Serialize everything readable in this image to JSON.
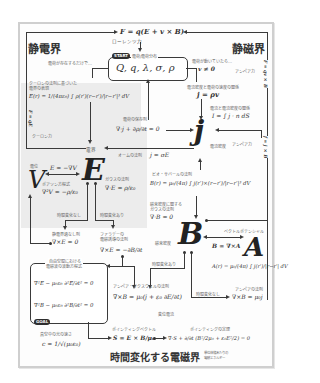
{
  "colors": {
    "panel_border": "#cfcfcf",
    "shade": "#ececec",
    "ink": "#2b2b2b",
    "badge": "#2e2e2e"
  },
  "headings": {
    "electrostatic": "静電界",
    "magnetostatic": "静磁界",
    "time_varying": "時間変化する電磁界"
  },
  "top": {
    "lorentz_force_eq": "F = q(E + v × B)",
    "lorentz_force_label": "ローレンツ力"
  },
  "start": {
    "badge": "START",
    "label": "電荷/電荷分布",
    "charges": "Q, q, λ, σ, ρ",
    "exists_only": "電荷が存在するだけで…",
    "if_moving": "電荷が動いていたら…",
    "v_nonzero": "v ≠ 0"
  },
  "coulomb": {
    "label1": "クーロンの法則に基づいた",
    "label2": "電界の表現",
    "eq": "E(r) = 1/(4πε₀) ∫ ρ(r′)(r−r′)/|r−r′|³ dV",
    "force_eq": "F = qE",
    "force_label": "クーロン力"
  },
  "current": {
    "density_rel_label": "電流密度と電荷の速度の関係",
    "density_rel_eq": "j = ρv",
    "current_rel_label": "電流と電流密度の関係",
    "current_rel_eq": "I = ∫ j · n dS",
    "continuity_label": "電荷の保存則",
    "continuity_eq": "∇·j + ∂ρ/∂t = 0",
    "symbol": "j",
    "symbol_label": "電流密度",
    "ohm_label": "オームの法則",
    "ohm_eq": "j = σE",
    "ampere_force_label": "アンペア力",
    "ampere_force_eq_top": "F = qv × B",
    "ampere_force_eq_mid": "f = j × B"
  },
  "efield": {
    "symbol": "E",
    "label": "電界",
    "gauss_label": "ガウスの法則",
    "gauss_eq": "∇·E = ρ/ε₀",
    "no_time_change": "時間変化なし",
    "time_change": "時間変化あり",
    "electrostatic_label": "静電界過なし則",
    "curl_zero_eq": "∇×E = 0",
    "faraday_label1": "ファラデーの",
    "faraday_label2": "電磁誘導の法則",
    "faraday_eq": "∇×E = −∂B/∂t"
  },
  "potential": {
    "symbol": "V",
    "label": "電位",
    "grad_eq": "E = −∇V",
    "poisson_label": "ポアソン方程式",
    "poisson_eq": "∇²V = −ρ/ε₀"
  },
  "bfield": {
    "biot_label": "ビオ・サバールの法則",
    "biot_eq": "B(r) = μ₀/(4π) ∫ j(r′)×(r−r′)/|r−r′|³ dV",
    "gauss_label1": "磁束密度に関する",
    "gauss_label2": "ガウスの法則",
    "gauss_eq": "∇·B = 0",
    "symbol": "B",
    "symbol_label": "磁束密度",
    "time_change": "時間変化あり",
    "no_time_change": "時間変化なし",
    "ampere_label": "アンペアの法則",
    "ampere_eq": "∇×B = μ₀j"
  },
  "vector_potential": {
    "label": "ベクトルポテンシャル",
    "eq": "B = ∇×A",
    "symbol": "A",
    "integral_eq": "A(r) = μ₀/(4π) ∫ j(r′)/|r−r′| dV"
  },
  "waves": {
    "label1": "自由空間における",
    "label2": "電磁波の波動方程式",
    "eq_e": "∇²E − μ₀ε₀ ∂²E/∂t² = 0",
    "eq_b": "∇²B − μ₀ε₀ ∂²B/∂t² = 0",
    "goal_badge": "GOAL",
    "light_label": "真空中の光の速さ",
    "light_eq": "c = 1/√(μ₀ε₀)"
  },
  "maxwell_ampere": {
    "label": "アンペア・マクスウェルの法則",
    "eq": "∇×B = μ₀(j + ε₀ ∂E/∂t)",
    "sub_label": "変位電流"
  },
  "poynting": {
    "vector_label": "ポインティングベクトル",
    "vector_eq": "S = E × B/μ₀",
    "theorem_label": "ポインティングの定理",
    "theorem_eq": "∇·S + ∂/∂t (B²/2μ₀ + ε₀E²/2) = 0",
    "energy_label1": "単位体積あたりの",
    "energy_label2": "電磁エネルギー"
  }
}
